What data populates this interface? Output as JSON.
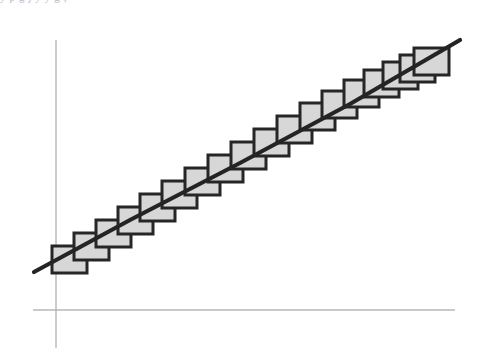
{
  "figure": {
    "kind": "line-with-overlapping-squares",
    "background_color": "#ffffff",
    "width": 479,
    "height": 355
  },
  "top_text_remnant": {
    "visible": true,
    "text": "y  p   g  j          y        y              g             ,"
  },
  "axes": {
    "line_color": "#b6b6bc",
    "line_width": 1.4,
    "vertical": {
      "name": "y-axis",
      "x": 56,
      "y_top": 40,
      "y_bottom": 348
    },
    "horizontal": {
      "name": "x-axis",
      "y": 310,
      "x_left": 33,
      "x_right": 455
    },
    "ticks": [],
    "tick_labels": [],
    "axis_titles": {
      "x": "",
      "y": ""
    }
  },
  "chart_data": {
    "type": "scatter",
    "title": "",
    "subtitle": "",
    "xlabel": "",
    "ylabel": "",
    "xlim": [
      33,
      470
    ],
    "ylim": [
      30,
      310
    ],
    "grid": false,
    "legend": null,
    "legend_position": "none",
    "annotations": [],
    "tick_labels_x": [],
    "tick_labels_y": [],
    "series": [
      {
        "name": "regression-line",
        "type": "line",
        "color": "#242424",
        "line_width": 4.2,
        "x": [
          34,
          130,
          240,
          350,
          460
        ],
        "y": [
          272,
          220,
          163,
          104,
          40
        ]
      },
      {
        "name": "data-squares",
        "type": "squares",
        "fill_color": "#d7d7d7",
        "stroke_color": "#262626",
        "stroke_width": 3,
        "count": 18,
        "box_width": 35,
        "box_height": 27,
        "x": [
          52,
          74,
          96,
          118,
          140,
          162,
          185,
          208,
          231,
          254,
          277,
          300,
          322,
          344,
          364,
          383,
          400,
          414
        ],
        "y": [
          246,
          233,
          220,
          207,
          194,
          181,
          168,
          155,
          142,
          129,
          116,
          103,
          91,
          80,
          70,
          62,
          55,
          48
        ]
      }
    ]
  }
}
